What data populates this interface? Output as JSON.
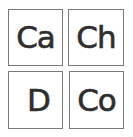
{
  "tiles": [
    {
      "label": "Ca"
    },
    {
      "label": "Ch"
    },
    {
      "label": "D"
    },
    {
      "label": "Co"
    }
  ],
  "colors": {
    "border": "#7a7a7a",
    "text": "#2e2e2e",
    "background": "#ffffff"
  }
}
